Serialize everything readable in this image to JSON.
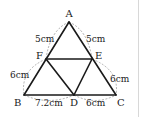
{
  "diagram": {
    "type": "geometry-triangle",
    "vertices": {
      "A": {
        "label": "A",
        "x": 69,
        "y": 22
      },
      "B": {
        "label": "B",
        "x": 24,
        "y": 95
      },
      "C": {
        "label": "C",
        "x": 116,
        "y": 95
      },
      "D": {
        "label": "D",
        "x": 74,
        "y": 95
      },
      "E": {
        "label": "E",
        "x": 92,
        "y": 59
      },
      "F": {
        "label": "F",
        "x": 46,
        "y": 59
      }
    },
    "segments": [
      {
        "from": "A",
        "to": "B"
      },
      {
        "from": "A",
        "to": "C"
      },
      {
        "from": "B",
        "to": "C"
      },
      {
        "from": "F",
        "to": "E"
      },
      {
        "from": "F",
        "to": "D"
      },
      {
        "from": "E",
        "to": "D"
      }
    ],
    "measurements": {
      "AF": "5cm",
      "AE": "5cm",
      "FB": "6cm",
      "EC": "6cm",
      "BD": "7.2cm",
      "DC": "6cm"
    }
  }
}
